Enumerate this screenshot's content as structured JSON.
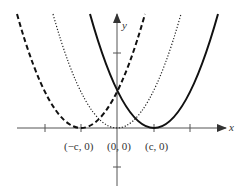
{
  "figure": {
    "axes": {
      "x_label": "x",
      "y_label": "y",
      "origin_px": [
        117,
        128
      ],
      "unit_px": 37,
      "x_ticks": [
        -2,
        -1,
        0,
        1,
        2
      ],
      "y_ticks": [
        2,
        -1
      ]
    },
    "points": [
      {
        "label": "(−c, 0)",
        "x": -1,
        "y": 0
      },
      {
        "label": "(0, 0)",
        "x": 0,
        "y": 0
      },
      {
        "label": "(c, 0)",
        "x": 1,
        "y": 0
      }
    ],
    "curves": [
      {
        "name": "y = (x + c)^2",
        "style": "dashed",
        "vertex": [
          -1,
          0
        ]
      },
      {
        "name": "y = x^2",
        "style": "dotted",
        "vertex": [
          0,
          0
        ]
      },
      {
        "name": "y = (x − c)^2",
        "style": "solid",
        "vertex": [
          1,
          0
        ]
      }
    ],
    "intersection": {
      "x": 0,
      "y_px": 89
    },
    "colors": {
      "ink": "#111111",
      "axis": "#555555",
      "text": "#333333"
    }
  }
}
